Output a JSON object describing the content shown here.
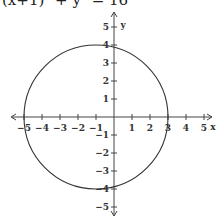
{
  "chart_data": {
    "type": "line",
    "title": "(x+1)² + y² = 16",
    "xlabel": "x",
    "ylabel": "y",
    "xlim": [
      -5.5,
      5.5
    ],
    "ylim": [
      -5.5,
      5.5
    ],
    "x_ticks": [
      -5,
      -4,
      -3,
      -2,
      -1,
      1,
      2,
      3,
      4,
      5
    ],
    "y_ticks": [
      5,
      4,
      3,
      2,
      1,
      -1,
      -2,
      -3,
      -4,
      -5
    ],
    "grid": false,
    "series": [
      {
        "name": "circle",
        "shape": "circle",
        "center": [
          -1,
          0
        ],
        "radius": 4
      }
    ],
    "colors": {
      "axis": "#444444",
      "curve": "#333333"
    }
  }
}
